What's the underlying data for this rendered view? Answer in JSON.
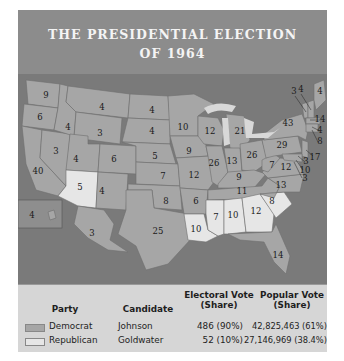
{
  "title": {
    "line1": "THE PRESIDENTIAL ELECTION",
    "line2": "OF 1964"
  },
  "colors": {
    "democrat": "#a6a6a6",
    "republican": "#e6e6e6",
    "water": "#7a7a7a",
    "title_band": "#8c8c8c"
  },
  "map": {
    "states": [
      {
        "abbr": "WA",
        "ev": "9",
        "party": "D"
      },
      {
        "abbr": "OR",
        "ev": "6",
        "party": "D"
      },
      {
        "abbr": "CA",
        "ev": "40",
        "party": "D"
      },
      {
        "abbr": "ID",
        "ev": "4",
        "party": "D"
      },
      {
        "abbr": "NV",
        "ev": "3",
        "party": "D"
      },
      {
        "abbr": "MT",
        "ev": "4",
        "party": "D"
      },
      {
        "abbr": "WY",
        "ev": "3",
        "party": "D"
      },
      {
        "abbr": "UT",
        "ev": "4",
        "party": "D"
      },
      {
        "abbr": "CO",
        "ev": "6",
        "party": "D"
      },
      {
        "abbr": "AZ",
        "ev": "5",
        "party": "R"
      },
      {
        "abbr": "NM",
        "ev": "4",
        "party": "D"
      },
      {
        "abbr": "ND",
        "ev": "4",
        "party": "D"
      },
      {
        "abbr": "SD",
        "ev": "4",
        "party": "D"
      },
      {
        "abbr": "NE",
        "ev": "5",
        "party": "D"
      },
      {
        "abbr": "KS",
        "ev": "7",
        "party": "D"
      },
      {
        "abbr": "OK",
        "ev": "8",
        "party": "D"
      },
      {
        "abbr": "TX",
        "ev": "25",
        "party": "D"
      },
      {
        "abbr": "MN",
        "ev": "10",
        "party": "D"
      },
      {
        "abbr": "IA",
        "ev": "9",
        "party": "D"
      },
      {
        "abbr": "MO",
        "ev": "12",
        "party": "D"
      },
      {
        "abbr": "AR",
        "ev": "6",
        "party": "D"
      },
      {
        "abbr": "LA",
        "ev": "10",
        "party": "R"
      },
      {
        "abbr": "WI",
        "ev": "12",
        "party": "D"
      },
      {
        "abbr": "IL",
        "ev": "26",
        "party": "D"
      },
      {
        "abbr": "MI",
        "ev": "21",
        "party": "D"
      },
      {
        "abbr": "IN",
        "ev": "13",
        "party": "D"
      },
      {
        "abbr": "OH",
        "ev": "26",
        "party": "D"
      },
      {
        "abbr": "KY",
        "ev": "9",
        "party": "D"
      },
      {
        "abbr": "TN",
        "ev": "11",
        "party": "D"
      },
      {
        "abbr": "MS",
        "ev": "7",
        "party": "R"
      },
      {
        "abbr": "AL",
        "ev": "10",
        "party": "R"
      },
      {
        "abbr": "GA",
        "ev": "12",
        "party": "R"
      },
      {
        "abbr": "SC",
        "ev": "8",
        "party": "R"
      },
      {
        "abbr": "FL",
        "ev": "14",
        "party": "D"
      },
      {
        "abbr": "NC",
        "ev": "13",
        "party": "D"
      },
      {
        "abbr": "VA",
        "ev": "12",
        "party": "D"
      },
      {
        "abbr": "WV",
        "ev": "7",
        "party": "D"
      },
      {
        "abbr": "PA",
        "ev": "29",
        "party": "D"
      },
      {
        "abbr": "NY",
        "ev": "43",
        "party": "D"
      },
      {
        "abbr": "VT",
        "ev": "3",
        "party": "D"
      },
      {
        "abbr": "NH",
        "ev": "4",
        "party": "D"
      },
      {
        "abbr": "ME",
        "ev": "4",
        "party": "D"
      },
      {
        "abbr": "MA",
        "ev": "14",
        "party": "D"
      },
      {
        "abbr": "RI",
        "ev": "4",
        "party": "D"
      },
      {
        "abbr": "CT",
        "ev": "8",
        "party": "D"
      },
      {
        "abbr": "NJ",
        "ev": "17",
        "party": "D"
      },
      {
        "abbr": "DE",
        "ev": "3",
        "party": "D"
      },
      {
        "abbr": "MD",
        "ev": "10",
        "party": "D"
      },
      {
        "abbr": "DC",
        "ev": "3",
        "party": "D"
      },
      {
        "abbr": "AK",
        "ev": "3",
        "party": "D"
      },
      {
        "abbr": "HI",
        "ev": "4",
        "party": "D"
      }
    ]
  },
  "legend": {
    "headers": {
      "party": "Party",
      "candidate": "Candidate",
      "electoral_line1": "Electoral Vote",
      "electoral_line2": "(Share)",
      "popular_line1": "Popular Vote",
      "popular_line2": "(Share)"
    },
    "rows": [
      {
        "party": "Democrat",
        "candidate": "Johnson",
        "electoral": "486 (90%)",
        "popular": "42,825,463 (61%)"
      },
      {
        "party": "Republican",
        "candidate": "Goldwater",
        "electoral": "52 (10%)",
        "popular": "27,146,969 (38.4%)"
      }
    ]
  }
}
